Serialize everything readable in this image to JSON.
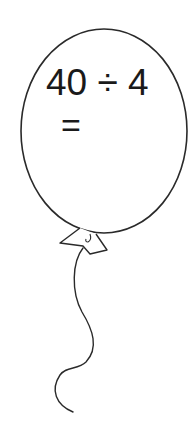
{
  "worksheet": {
    "balloon": {
      "problem": "40 ÷ 4",
      "answer_prefix": "=",
      "answer_value": "",
      "outline_color": "#2a2a2a",
      "fill_color": "#ffffff"
    }
  }
}
